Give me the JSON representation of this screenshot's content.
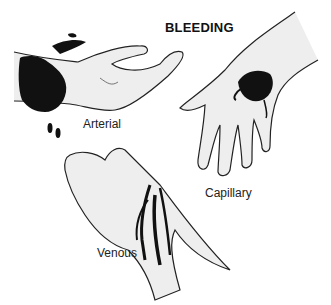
{
  "title": "BLEEDING",
  "labels": {
    "arterial": "Arterial",
    "capillary": "Capillary",
    "venous": "Venous"
  },
  "colors": {
    "blood": "#111111",
    "outline": "#222222",
    "skin": "#eeeeee"
  }
}
